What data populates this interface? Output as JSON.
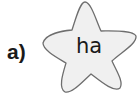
{
  "exercise": {
    "label": "a)",
    "star": {
      "text": "ha",
      "fill_color": "#f0f0f0",
      "stroke_color": "#6e6e6e"
    }
  }
}
